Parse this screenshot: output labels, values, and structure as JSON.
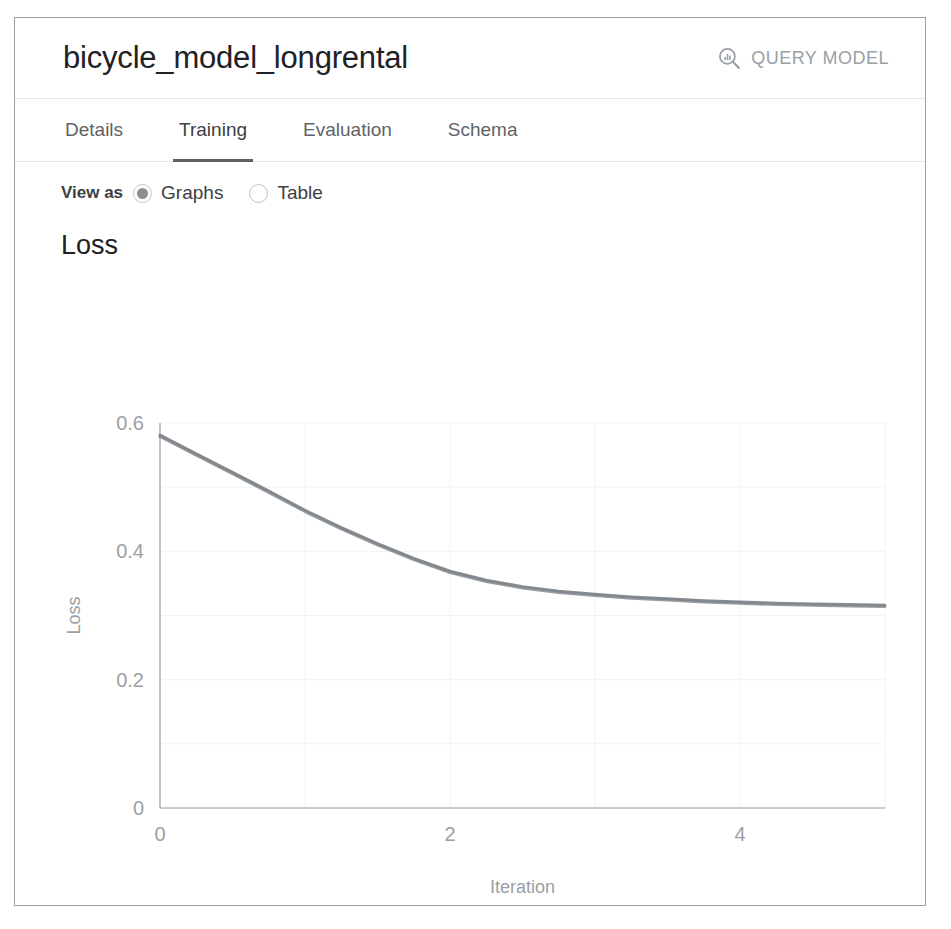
{
  "header": {
    "title": "bicycle_model_longrental",
    "query_button": {
      "label": "QUERY MODEL",
      "icon": "search-chart-icon"
    }
  },
  "tabs": [
    {
      "label": "Details",
      "active": false
    },
    {
      "label": "Training",
      "active": true
    },
    {
      "label": "Evaluation",
      "active": false
    },
    {
      "label": "Schema",
      "active": false
    }
  ],
  "view_as": {
    "label": "View as",
    "options": [
      {
        "label": "Graphs",
        "selected": true
      },
      {
        "label": "Table",
        "selected": false
      }
    ]
  },
  "section": {
    "title": "Loss"
  },
  "colors": {
    "card_border": "#9aa0a6",
    "divider": "#e3e5e8",
    "title_text": "#202124",
    "muted_text": "#9aa0a6",
    "tab_text": "#5f6368",
    "tab_indicator": "#5f6368",
    "line": "#80868b",
    "grid": "#f1f3f4",
    "axis": "#9aa0a6"
  },
  "chart_data": {
    "type": "line",
    "title": "Loss",
    "xlabel": "Iteration",
    "ylabel": "Loss",
    "xlim": [
      0,
      5
    ],
    "ylim": [
      0,
      0.6
    ],
    "xticks": [
      0,
      2,
      4
    ],
    "xtick_labels": [
      "0",
      "2",
      "4"
    ],
    "yticks": [
      0,
      0.2,
      0.4,
      0.6
    ],
    "ytick_labels": [
      "0",
      "0.2",
      "0.4",
      "0.6"
    ],
    "grid": true,
    "legend": "none",
    "x": [
      0,
      0.25,
      0.5,
      0.75,
      1,
      1.25,
      1.5,
      1.75,
      2,
      2.25,
      2.5,
      2.75,
      3,
      3.25,
      3.5,
      3.75,
      4,
      4.25,
      4.5,
      4.75,
      5
    ],
    "series": [
      {
        "name": "Training loss",
        "values": [
          0.581,
          0.552,
          0.523,
          0.494,
          0.464,
          0.437,
          0.412,
          0.389,
          0.369,
          0.355,
          0.345,
          0.338,
          0.333,
          0.329,
          0.326,
          0.323,
          0.321,
          0.319,
          0.318,
          0.317,
          0.316
        ]
      },
      {
        "name": "Evaluation loss",
        "values": [
          0.579,
          0.55,
          0.521,
          0.492,
          0.462,
          0.435,
          0.41,
          0.387,
          0.367,
          0.353,
          0.343,
          0.336,
          0.331,
          0.327,
          0.324,
          0.321,
          0.319,
          0.317,
          0.316,
          0.315,
          0.314
        ]
      }
    ]
  }
}
